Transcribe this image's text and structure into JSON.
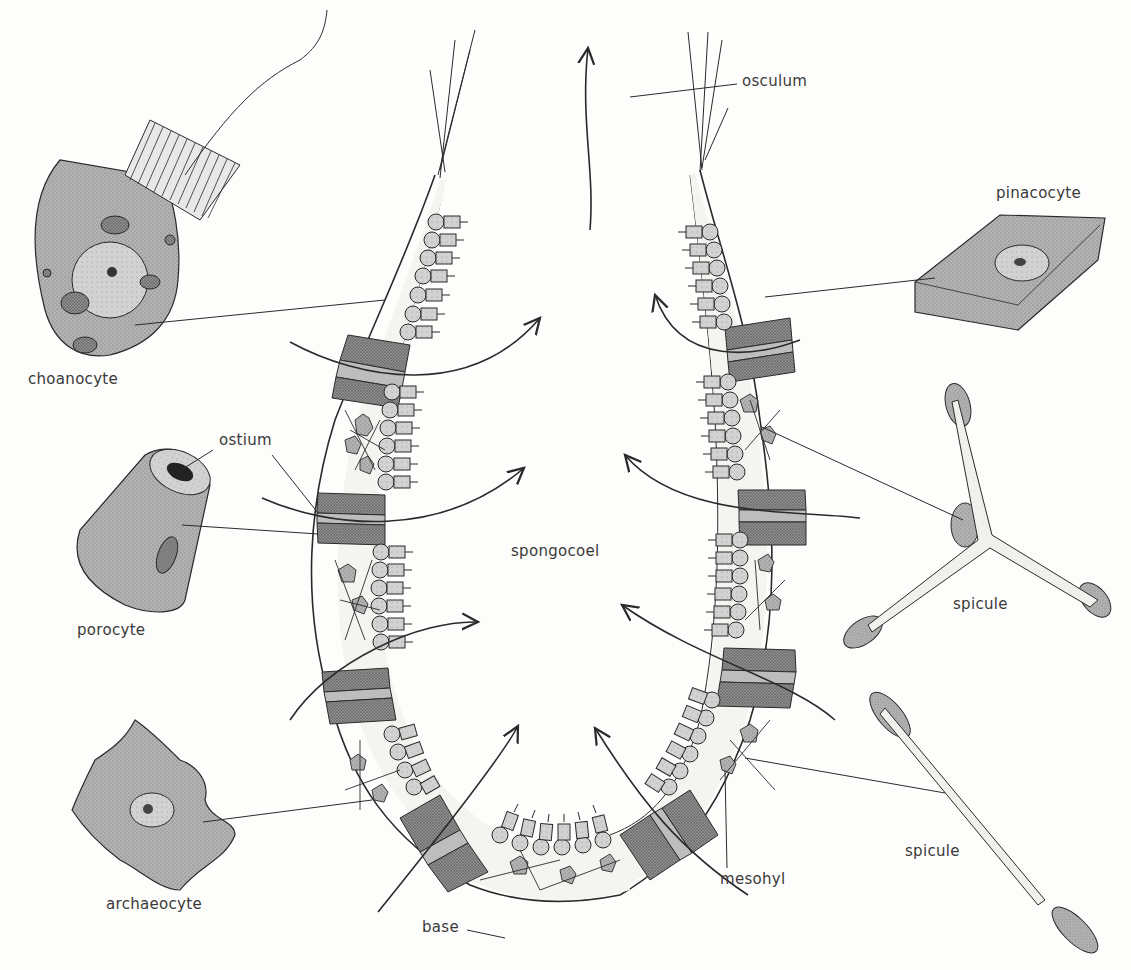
{
  "figure": {
    "center_label": "spongocoel",
    "labels": {
      "choanocyte": "choanocyte",
      "ostium": "ostium",
      "porocyte": "porocyte",
      "archaeocyte": "archaeocyte",
      "osculum": "osculum",
      "pinacocyte": "pinacocyte",
      "spicule_triradiate": "spicule",
      "spicule_monaxon": "spicule",
      "mesohyl": "mesohyl",
      "base": "base",
      "spongocoel": "spongocoel"
    },
    "colors": {
      "ink": "#2a2a2a",
      "cell_fill": "#a9a9a9",
      "cell_fill_light": "#c4c4c4",
      "dark_band": "#8c8c8c",
      "background": "#fdfdfb",
      "label_text": "#3a3a3a"
    }
  }
}
